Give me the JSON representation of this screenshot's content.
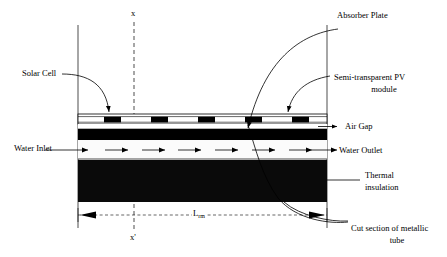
{
  "figure": {
    "type": "technical-cross-section-diagram"
  },
  "labels": {
    "solar_cell": "Solar Cell",
    "water_inlet": "Water Inlet",
    "absorber_plate": "Absorber Plate",
    "semi_transparent_pv_line1": "Semi-transparent PV",
    "semi_transparent_pv_line2": "module",
    "air_gap": "Air Gap",
    "water_outlet": "Water Outlet",
    "thermal_insulation_line1": "Thermal",
    "thermal_insulation_line2": "insulation",
    "cut_section_line1": "Cut section of metallic",
    "cut_section_line2": "tube"
  },
  "axes": {
    "x_top": "x",
    "x_bottom": "x'"
  },
  "dimension": {
    "symbol": "L",
    "subscript": "rm",
    "full": "Lrm"
  },
  "colors": {
    "ink": "#000000",
    "paper": "#ffffff",
    "cell_fill": "#000000",
    "absorber_fill": "#000000",
    "insulation_fill": "#0a0a0a",
    "glass_fill": "#ffffff",
    "water_fill": "#fbfbfb"
  },
  "geometry": {
    "solar_cell_count": 5,
    "flow_arrow_count": 6,
    "left_boundary_x": 78,
    "right_boundary_x": 327,
    "section_line_x": 134
  }
}
